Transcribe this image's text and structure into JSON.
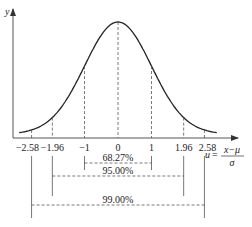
{
  "chart_data": {
    "type": "line",
    "title": "",
    "ylabel": "y",
    "xlabel": "u = (x−μ)/σ",
    "xlabel_parts": {
      "lhs": "u",
      "eq": "=",
      "numerator": "x−μ",
      "denominator": "σ"
    },
    "x_ticks": [
      {
        "value": -2.58,
        "label": "−2.58"
      },
      {
        "value": -1.96,
        "label": "−1.96"
      },
      {
        "value": -1,
        "label": "−1"
      },
      {
        "value": 0,
        "label": "0"
      },
      {
        "value": 1,
        "label": "1"
      },
      {
        "value": 1.96,
        "label": "1.96"
      },
      {
        "value": 2.58,
        "label": "2.58"
      }
    ],
    "intervals": [
      {
        "from": -1,
        "to": 1,
        "label": "68.27%"
      },
      {
        "from": -1.96,
        "to": 1.96,
        "label": "95.00%"
      },
      {
        "from": -2.58,
        "to": 2.58,
        "label": "99.00%"
      }
    ],
    "grid": false,
    "legend": null
  },
  "caption": ""
}
